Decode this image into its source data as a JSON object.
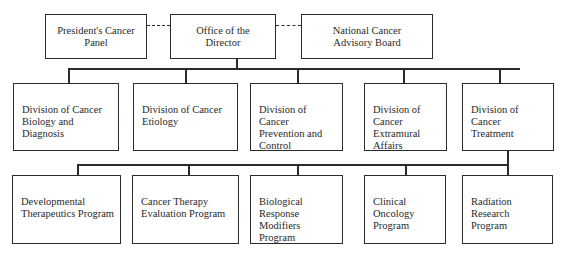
{
  "diagram": {
    "type": "org-chart",
    "top": [
      {
        "id": "presidents-panel",
        "label": "President's Cancer Panel",
        "lines": [
          "President's Cancer",
          "Panel"
        ]
      },
      {
        "id": "office-director",
        "label": "Office of the Director",
        "lines": [
          "Office of the",
          "Director"
        ]
      },
      {
        "id": "advisory-board",
        "label": "National Cancer Advisory Board",
        "lines": [
          "National Cancer",
          "Advisory Board"
        ]
      }
    ],
    "advisory_links": [
      {
        "from": "presidents-panel",
        "to": "office-director",
        "style": "dashed"
      },
      {
        "from": "office-director",
        "to": "advisory-board",
        "style": "dashed"
      }
    ],
    "divisions": [
      {
        "id": "div-biology",
        "lines": [
          "Division of Cancer",
          "Biology and",
          "Diagnosis"
        ]
      },
      {
        "id": "div-etiology",
        "lines": [
          "Division of Cancer",
          "Etiology"
        ]
      },
      {
        "id": "div-prevention",
        "lines": [
          "Division of Cancer",
          "Prevention and",
          "Control"
        ]
      },
      {
        "id": "div-extramural",
        "lines": [
          "Division of Cancer",
          "Extramural",
          "Affairs"
        ]
      },
      {
        "id": "div-treatment",
        "lines": [
          "Division of Cancer",
          "Treatment"
        ]
      }
    ],
    "programs": [
      {
        "id": "prog-developmental",
        "parent": "div-treatment",
        "lines": [
          "Developmental",
          "Therapeutics Program"
        ]
      },
      {
        "id": "prog-evaluation",
        "parent": "div-treatment",
        "lines": [
          "Cancer Therapy",
          "Evaluation Program"
        ]
      },
      {
        "id": "prog-brm",
        "parent": "div-treatment",
        "lines": [
          "Biological",
          "Response",
          "Modifiers Program"
        ]
      },
      {
        "id": "prog-clinical",
        "parent": "div-treatment",
        "lines": [
          "Clinical Oncology",
          "Program"
        ]
      },
      {
        "id": "prog-radiation",
        "parent": "div-treatment",
        "lines": [
          "Radiation Research",
          "Program"
        ]
      }
    ]
  }
}
